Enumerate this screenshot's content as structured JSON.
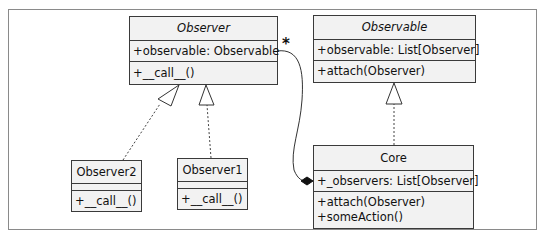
{
  "diagram": {
    "type": "UML class diagram",
    "classes": {
      "observer": {
        "name": "Observer",
        "abstract": true,
        "attributes": [
          "+observable: Observable"
        ],
        "methods": [
          "+__call__()"
        ]
      },
      "observable": {
        "name": "Observable",
        "abstract": true,
        "attributes": [
          "+observable: List[Observer]"
        ],
        "methods": [
          "+attach(Observer)"
        ]
      },
      "observer2": {
        "name": "Observer2",
        "abstract": false,
        "attributes": [],
        "methods": [
          "+__call__()"
        ]
      },
      "observer1": {
        "name": "Observer1",
        "abstract": false,
        "attributes": [],
        "methods": [
          "+__call__()"
        ]
      },
      "core": {
        "name": "Core",
        "abstract": false,
        "attributes": [
          "+_observers: List[Observer]"
        ],
        "methods": [
          "+attach(Observer)",
          "+someAction()"
        ]
      }
    },
    "relations": [
      {
        "from": "Observer2",
        "to": "Observer",
        "type": "realization"
      },
      {
        "from": "Observer1",
        "to": "Observer",
        "type": "realization"
      },
      {
        "from": "Core",
        "to": "Observable",
        "type": "realization"
      },
      {
        "from": "Core",
        "to": "Observer",
        "type": "composition",
        "multiplicity": "*"
      }
    ],
    "multiplicity_label": "*",
    "colors": {
      "box_fill": "#f2f2f2",
      "box_border": "#3a3a3a",
      "frame_border": "#8a8a8a",
      "line": "#333333"
    }
  }
}
